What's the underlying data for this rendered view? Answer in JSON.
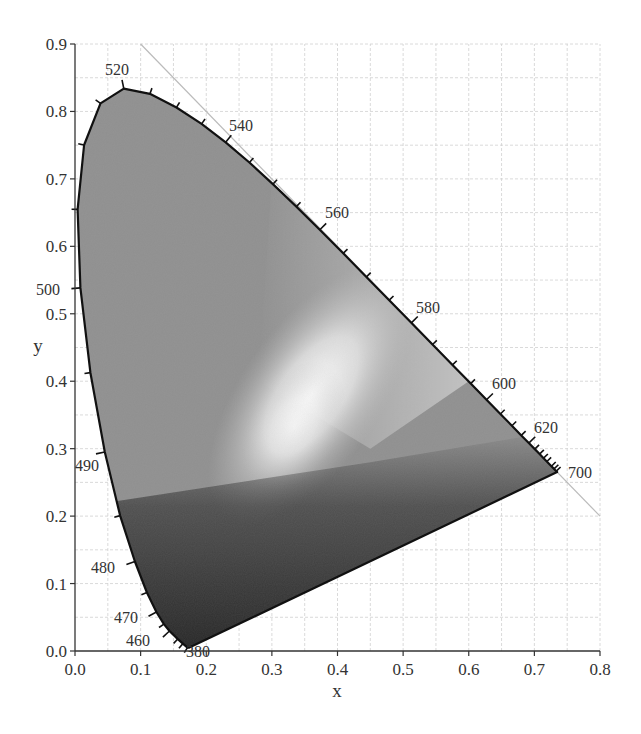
{
  "chart_data": {
    "type": "scatter",
    "title": "",
    "subtitle": "CIE 1931 chromaticity diagram (grayscale)",
    "xlabel": "x",
    "ylabel": "y",
    "xlim": [
      0.0,
      0.8
    ],
    "ylim": [
      0.0,
      0.9
    ],
    "grid": true,
    "legend": null,
    "x_ticks": [
      "0.0",
      "0.1",
      "0.2",
      "0.3",
      "0.4",
      "0.5",
      "0.6",
      "0.7",
      "0.8"
    ],
    "y_ticks": [
      "0.0",
      "0.1",
      "0.2",
      "0.3",
      "0.4",
      "0.5",
      "0.6",
      "0.7",
      "0.8",
      "0.9"
    ],
    "series": [
      {
        "name": "spectral locus",
        "points": [
          {
            "nm": 380,
            "x": 0.1741,
            "y": 0.005
          },
          {
            "nm": 420,
            "x": 0.1714,
            "y": 0.0051
          },
          {
            "nm": 440,
            "x": 0.1644,
            "y": 0.0109
          },
          {
            "nm": 450,
            "x": 0.1566,
            "y": 0.0177
          },
          {
            "nm": 460,
            "x": 0.144,
            "y": 0.0297
          },
          {
            "nm": 465,
            "x": 0.1355,
            "y": 0.0399
          },
          {
            "nm": 470,
            "x": 0.1241,
            "y": 0.0578
          },
          {
            "nm": 475,
            "x": 0.1096,
            "y": 0.0868
          },
          {
            "nm": 480,
            "x": 0.0913,
            "y": 0.1327
          },
          {
            "nm": 485,
            "x": 0.0687,
            "y": 0.2007
          },
          {
            "nm": 490,
            "x": 0.0454,
            "y": 0.295
          },
          {
            "nm": 495,
            "x": 0.0235,
            "y": 0.4127
          },
          {
            "nm": 500,
            "x": 0.0082,
            "y": 0.5384
          },
          {
            "nm": 505,
            "x": 0.0039,
            "y": 0.6548
          },
          {
            "nm": 510,
            "x": 0.0139,
            "y": 0.7502
          },
          {
            "nm": 515,
            "x": 0.0389,
            "y": 0.812
          },
          {
            "nm": 520,
            "x": 0.0743,
            "y": 0.8338
          },
          {
            "nm": 525,
            "x": 0.1142,
            "y": 0.8262
          },
          {
            "nm": 530,
            "x": 0.1547,
            "y": 0.8059
          },
          {
            "nm": 535,
            "x": 0.1929,
            "y": 0.7816
          },
          {
            "nm": 540,
            "x": 0.2296,
            "y": 0.7543
          },
          {
            "nm": 545,
            "x": 0.2658,
            "y": 0.7243
          },
          {
            "nm": 550,
            "x": 0.3016,
            "y": 0.6923
          },
          {
            "nm": 555,
            "x": 0.3373,
            "y": 0.6589
          },
          {
            "nm": 560,
            "x": 0.3731,
            "y": 0.6245
          },
          {
            "nm": 565,
            "x": 0.4087,
            "y": 0.5896
          },
          {
            "nm": 570,
            "x": 0.4441,
            "y": 0.5547
          },
          {
            "nm": 575,
            "x": 0.4788,
            "y": 0.5202
          },
          {
            "nm": 580,
            "x": 0.5125,
            "y": 0.4866
          },
          {
            "nm": 585,
            "x": 0.5448,
            "y": 0.4544
          },
          {
            "nm": 590,
            "x": 0.5752,
            "y": 0.4242
          },
          {
            "nm": 595,
            "x": 0.6029,
            "y": 0.3965
          },
          {
            "nm": 600,
            "x": 0.627,
            "y": 0.3725
          },
          {
            "nm": 605,
            "x": 0.6482,
            "y": 0.3514
          },
          {
            "nm": 610,
            "x": 0.6658,
            "y": 0.334
          },
          {
            "nm": 615,
            "x": 0.6801,
            "y": 0.3197
          },
          {
            "nm": 620,
            "x": 0.6915,
            "y": 0.3083
          },
          {
            "nm": 625,
            "x": 0.7006,
            "y": 0.2993
          },
          {
            "nm": 630,
            "x": 0.7079,
            "y": 0.292
          },
          {
            "nm": 635,
            "x": 0.714,
            "y": 0.2859
          },
          {
            "nm": 640,
            "x": 0.719,
            "y": 0.2809
          },
          {
            "nm": 650,
            "x": 0.726,
            "y": 0.274
          },
          {
            "nm": 660,
            "x": 0.73,
            "y": 0.27
          },
          {
            "nm": 680,
            "x": 0.7334,
            "y": 0.2666
          },
          {
            "nm": 700,
            "x": 0.7347,
            "y": 0.2653
          }
        ]
      },
      {
        "name": "x + y = 1 reference line",
        "points": [
          {
            "x": 0.1,
            "y": 0.9
          },
          {
            "x": 0.8,
            "y": 0.2
          }
        ]
      }
    ],
    "annotations": [
      {
        "text": "380",
        "x": 0.174,
        "y": 0.005
      },
      {
        "text": "460",
        "x": 0.144,
        "y": 0.03
      },
      {
        "text": "470",
        "x": 0.124,
        "y": 0.058
      },
      {
        "text": "480",
        "x": 0.091,
        "y": 0.133
      },
      {
        "text": "490",
        "x": 0.045,
        "y": 0.295
      },
      {
        "text": "500",
        "x": 0.008,
        "y": 0.538
      },
      {
        "text": "520",
        "x": 0.074,
        "y": 0.834
      },
      {
        "text": "540",
        "x": 0.23,
        "y": 0.754
      },
      {
        "text": "560",
        "x": 0.373,
        "y": 0.625
      },
      {
        "text": "580",
        "x": 0.513,
        "y": 0.487
      },
      {
        "text": "600",
        "x": 0.627,
        "y": 0.373
      },
      {
        "text": "620",
        "x": 0.692,
        "y": 0.308
      },
      {
        "text": "700",
        "x": 0.735,
        "y": 0.265
      }
    ],
    "white_point": {
      "x": 0.333,
      "y": 0.333
    }
  },
  "labels": {
    "xlabel": "x",
    "ylabel": "y",
    "x_ticks": [
      "0.0",
      "0.1",
      "0.2",
      "0.3",
      "0.4",
      "0.5",
      "0.6",
      "0.7",
      "0.8"
    ],
    "y_ticks": [
      "0.0",
      "0.1",
      "0.2",
      "0.3",
      "0.4",
      "0.5",
      "0.6",
      "0.7",
      "0.8",
      "0.9"
    ],
    "wavelengths": {
      "w380": "380",
      "w460": "460",
      "w470": "470",
      "w480": "480",
      "w490": "490",
      "w500": "500",
      "w520": "520",
      "w540": "540",
      "w560": "560",
      "w580": "580",
      "w600": "600",
      "w620": "620",
      "w700": "700"
    }
  },
  "colors": {
    "locus_stroke": "#111111",
    "grid": "#d0d0d0",
    "reference_line": "#bbbbbb",
    "fill_mid": "#8c8c8c",
    "fill_bright": "#f4f4f4",
    "fill_dark": "#2e2e2e"
  }
}
